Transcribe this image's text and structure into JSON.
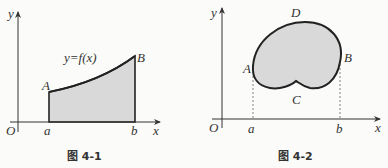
{
  "figures": [
    {
      "caption": "图 4-1",
      "axis_labels": {
        "x": "x",
        "y": "y",
        "origin": "O"
      },
      "points": {
        "A": "A",
        "B": "B"
      },
      "ticks": {
        "a": "a",
        "b": "b"
      },
      "function_label": "y=f(x)",
      "fill_color": "#d9d9d9"
    },
    {
      "caption": "图 4-2",
      "axis_labels": {
        "x": "x",
        "y": "y",
        "origin": "O"
      },
      "points": {
        "A": "A",
        "B": "B",
        "C": "C",
        "D": "D"
      },
      "ticks": {
        "a": "a",
        "b": "b"
      },
      "fill_color": "#d9d9d9"
    }
  ]
}
